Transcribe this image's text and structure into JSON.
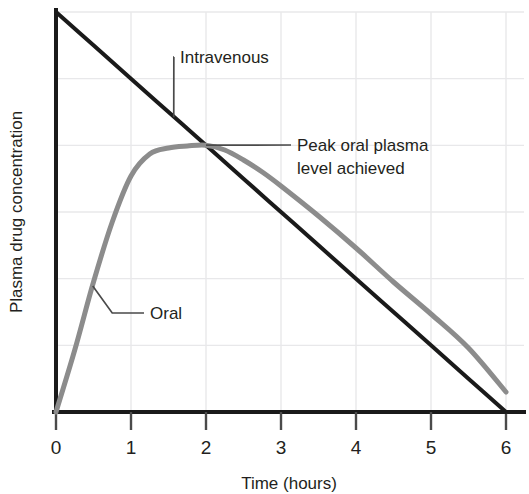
{
  "chart_data": {
    "type": "line",
    "title": "",
    "subtitle": "",
    "xlabel": "Time (hours)",
    "ylabel": "Plasma drug concentration",
    "xlim": [
      0,
      6
    ],
    "ylim": [
      0,
      1
    ],
    "xticks": [
      "0",
      "1",
      "2",
      "3",
      "4",
      "5",
      "6"
    ],
    "xtick_values": [
      0,
      1,
      2,
      3,
      4,
      5,
      6
    ],
    "yticks": [],
    "grid": true,
    "grid_color": "#e8e8ea",
    "legend": "none",
    "series": [
      {
        "name": "Intravenous",
        "color": "#1a1a1a",
        "width": 4,
        "x": [
          0,
          0.5,
          1,
          1.5,
          2,
          2.5,
          3,
          3.5,
          4,
          4.5,
          5,
          5.5,
          6
        ],
        "values": [
          1.0,
          0.9167,
          0.8333,
          0.75,
          0.6667,
          0.5833,
          0.5,
          0.4167,
          0.3333,
          0.25,
          0.1667,
          0.0833,
          0.0
        ]
      },
      {
        "name": "Oral",
        "color": "#8c8c8c",
        "width": 5,
        "x": [
          0,
          0.25,
          0.5,
          0.75,
          1,
          1.25,
          1.5,
          1.75,
          2,
          2.25,
          2.5,
          2.75,
          3,
          3.5,
          4,
          4.5,
          5,
          5.5,
          6
        ],
        "values": [
          0.0,
          0.155,
          0.325,
          0.475,
          0.59,
          0.645,
          0.66,
          0.665,
          0.667,
          0.655,
          0.63,
          0.6,
          0.565,
          0.49,
          0.41,
          0.325,
          0.245,
          0.16,
          0.05
        ]
      }
    ],
    "annotations": [
      {
        "id": "intravenous",
        "text": "Intravenous",
        "lines": [
          "Intravenous"
        ],
        "target_x": 1.57,
        "target_y": 0.737,
        "label_x": 180,
        "label_y": 63
      },
      {
        "id": "peak-oral",
        "text": "Peak oral plasma level achieved",
        "lines": [
          "Peak oral plasma",
          "level achieved"
        ],
        "target_x": 2.0,
        "target_y": 0.667,
        "label_x": 297,
        "label_y": 151
      },
      {
        "id": "oral",
        "text": "Oral",
        "lines": [
          "Oral"
        ],
        "target_x": 0.49,
        "target_y": 0.315,
        "label_x": 150,
        "label_y": 319
      }
    ]
  },
  "axes": {
    "axis_color": "#1a1a1a",
    "tick_color": "#4a4a4a",
    "leader_color": "#4a4a4a"
  }
}
